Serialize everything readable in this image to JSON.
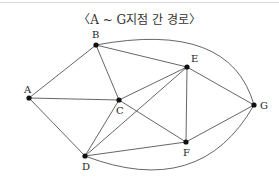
{
  "title": "〈A ~ G지점 간 경로〉",
  "nodes": [
    {
      "id": "A",
      "label": "A"
    },
    {
      "id": "B",
      "label": "B"
    },
    {
      "id": "C",
      "label": "C"
    },
    {
      "id": "D",
      "label": "D"
    },
    {
      "id": "E",
      "label": "E"
    },
    {
      "id": "F",
      "label": "F"
    },
    {
      "id": "G",
      "label": "G"
    }
  ],
  "edges": [
    [
      "A",
      "B"
    ],
    [
      "A",
      "C"
    ],
    [
      "A",
      "D"
    ],
    [
      "B",
      "C"
    ],
    [
      "B",
      "E"
    ],
    [
      "B",
      "G"
    ],
    [
      "C",
      "E"
    ],
    [
      "C",
      "F"
    ],
    [
      "C",
      "D"
    ],
    [
      "D",
      "E"
    ],
    [
      "D",
      "F"
    ],
    [
      "D",
      "G"
    ],
    [
      "E",
      "F"
    ],
    [
      "E",
      "G"
    ],
    [
      "F",
      "G"
    ]
  ]
}
